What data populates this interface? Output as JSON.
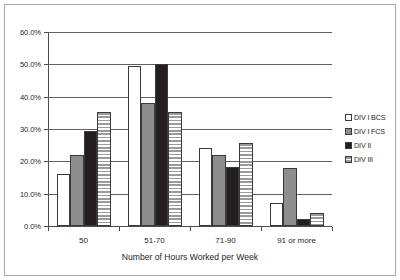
{
  "chart_data": {
    "type": "bar",
    "title": "",
    "subtitle": "",
    "xlabel": "Number of Hours Worked per Week",
    "ylabel": "",
    "categories": [
      "50",
      "51-70",
      "71-90",
      "91 or more"
    ],
    "series": [
      {
        "name": "DIV I BCS",
        "pattern": "open",
        "values": [
          16.2,
          49.5,
          24.0,
          7.0
        ]
      },
      {
        "name": "DIV I FCS",
        "pattern": "dotted",
        "values": [
          22.0,
          38.0,
          22.0,
          18.0
        ]
      },
      {
        "name": "DIV II",
        "pattern": "solid",
        "values": [
          29.5,
          50.0,
          18.3,
          2.2
        ]
      },
      {
        "name": "DIV III",
        "pattern": "hstripe",
        "values": [
          35.3,
          35.4,
          25.7,
          4.1
        ]
      }
    ],
    "ylim": [
      0,
      60
    ],
    "ytick_step": 10,
    "ytick_labels": [
      "0.0%",
      "10.0%",
      "20.0%",
      "30.0%",
      "40.0%",
      "50.0%",
      "60.0%"
    ],
    "ytick_values": [
      0,
      10,
      20,
      30,
      40,
      50,
      60
    ],
    "grid": true,
    "grid_axis": "y",
    "legend_position": "right",
    "colors": {
      "open": "#ffffff",
      "dotted": "#8e8e8e",
      "solid": "#231f20",
      "hstripe": "#9a9a9a",
      "axis": "#4d4d4d",
      "grid": "#606060",
      "text": "#231f20",
      "frame": "#a8a8a8",
      "background": "#ffffff"
    }
  }
}
